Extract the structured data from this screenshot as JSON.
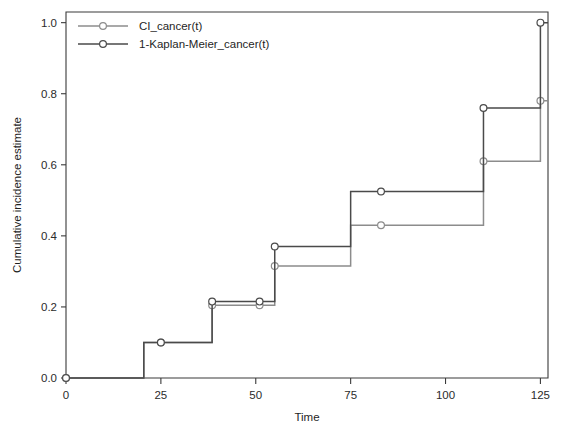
{
  "chart_data": {
    "type": "line",
    "title": "",
    "subtitle": "",
    "xlabel": "Time",
    "ylabel": "Cumulative incidence estimate",
    "xlim": [
      0,
      127
    ],
    "ylim": [
      0.0,
      1.03
    ],
    "xticks": [
      0,
      25,
      50,
      75,
      100,
      125
    ],
    "xtick_labels": [
      "0",
      "25",
      "50",
      "75",
      "100",
      "125"
    ],
    "yticks": [
      0.0,
      0.2,
      0.4,
      0.6,
      0.8,
      1.0
    ],
    "ytick_labels": [
      "0.0",
      "0.2",
      "0.4",
      "0.6",
      "0.8",
      "1.0"
    ],
    "grid": false,
    "legend_position": "top-left",
    "step_type": "post",
    "series": [
      {
        "name": "CI_cancer(t)",
        "color": "#8c8c8c",
        "marker": "circle-open",
        "x": [
          0,
          20.5,
          38.5,
          55,
          75,
          110,
          125
        ],
        "values": [
          0.0,
          0.1,
          0.205,
          0.315,
          0.43,
          0.61,
          0.78
        ],
        "markers": [
          {
            "x": 0,
            "y": 0.0
          },
          {
            "x": 25,
            "y": 0.1
          },
          {
            "x": 38.5,
            "y": 0.205
          },
          {
            "x": 51,
            "y": 0.205
          },
          {
            "x": 55,
            "y": 0.315
          },
          {
            "x": 83,
            "y": 0.43
          },
          {
            "x": 110,
            "y": 0.61
          },
          {
            "x": 125,
            "y": 0.78
          }
        ]
      },
      {
        "name": "1-Kaplan-Meier_cancer(t)",
        "color": "#4a4a4a",
        "marker": "circle-open",
        "x": [
          0,
          20.5,
          38.5,
          55,
          75,
          110,
          125
        ],
        "values": [
          0.0,
          0.1,
          0.215,
          0.37,
          0.525,
          0.76,
          1.0
        ],
        "markers": [
          {
            "x": 0,
            "y": 0.0
          },
          {
            "x": 25,
            "y": 0.1
          },
          {
            "x": 38.5,
            "y": 0.215
          },
          {
            "x": 51,
            "y": 0.215
          },
          {
            "x": 55,
            "y": 0.37
          },
          {
            "x": 83,
            "y": 0.525
          },
          {
            "x": 110,
            "y": 0.76
          },
          {
            "x": 125,
            "y": 1.0
          }
        ]
      }
    ]
  },
  "legend": {
    "entries": [
      {
        "label": "CI_cancer(t)",
        "color": "#8c8c8c"
      },
      {
        "label": "1-Kaplan-Meier_cancer(t)",
        "color": "#4a4a4a"
      }
    ]
  },
  "axes": {
    "x_title": "Time",
    "y_title": "Cumulative incidence estimate"
  }
}
